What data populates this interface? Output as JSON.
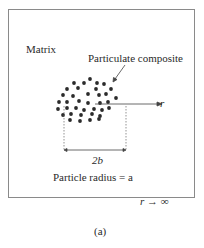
{
  "figure": {
    "caption": "(a)",
    "labels": {
      "matrix": "Matrix",
      "particulate_composite": "Particulate composite",
      "radial_axis": "r",
      "diameter": "2b",
      "particle_radius": "Particle radius = a",
      "far_field": "r → ∞"
    },
    "colors": {
      "frame": "#8a8a8a",
      "dots": "#2b2b2b",
      "text": "#2a2a2a"
    },
    "particles": [
      [
        90,
        79
      ],
      [
        74,
        83
      ],
      [
        84,
        83
      ],
      [
        97,
        83
      ],
      [
        104,
        84
      ],
      [
        67,
        89
      ],
      [
        78,
        88
      ],
      [
        96,
        89
      ],
      [
        111,
        89
      ],
      [
        63,
        95
      ],
      [
        73,
        96
      ],
      [
        88,
        94
      ],
      [
        99,
        95
      ],
      [
        106,
        94
      ],
      [
        116,
        98
      ],
      [
        59,
        102
      ],
      [
        67,
        102
      ],
      [
        79,
        101
      ],
      [
        88,
        103
      ],
      [
        100,
        103
      ],
      [
        108,
        102
      ],
      [
        58,
        109
      ],
      [
        67,
        108
      ],
      [
        76,
        108
      ],
      [
        84,
        110
      ],
      [
        94,
        109
      ],
      [
        102,
        110
      ],
      [
        109,
        108
      ],
      [
        63,
        115
      ],
      [
        71,
        114
      ],
      [
        81,
        115
      ],
      [
        92,
        114
      ],
      [
        100,
        116
      ],
      [
        70,
        120
      ],
      [
        80,
        121
      ],
      [
        90,
        120
      ],
      [
        99,
        119
      ]
    ]
  }
}
